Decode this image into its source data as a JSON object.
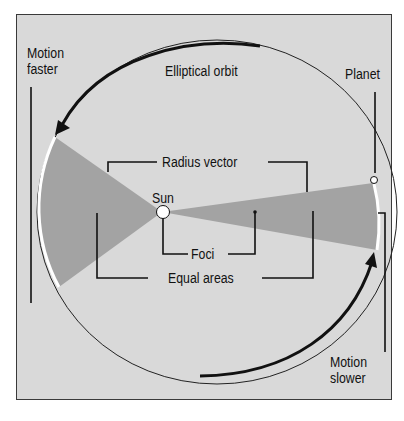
{
  "diagram": {
    "labels": {
      "motion_faster": [
        "Motion",
        "faster"
      ],
      "elliptical_orbit": "Elliptical orbit",
      "planet": "Planet",
      "radius_vector": "Radius vector",
      "sun": "Sun",
      "foci": "Foci",
      "equal_areas": "Equal areas",
      "motion_slower": [
        "Motion",
        "slower"
      ]
    },
    "colors": {
      "background": "#d9d9d9",
      "wedge": "#a3a3a3",
      "line": "#111111",
      "highlight_arc": "#ffffff"
    }
  }
}
